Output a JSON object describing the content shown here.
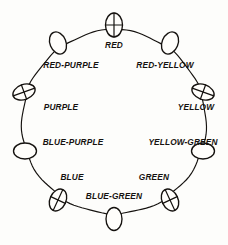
{
  "diagram": {
    "type": "color-wheel-diagram",
    "ink_color": "#15120f",
    "background_color": "#fdfdfb",
    "ring": {
      "center_x": 114,
      "center_y": 122,
      "radius": 92
    },
    "nodes": [
      {
        "id": "red",
        "label": "RED",
        "angle_deg": 90,
        "cx": 114,
        "cy": 25,
        "rx": 8.5,
        "ry": 12.0,
        "rotation_deg": 0,
        "mark": "cross",
        "label_x": 114,
        "label_y": 46,
        "label_anchor": "middle"
      },
      {
        "id": "red-yellow",
        "label": "RED-YELLOW",
        "angle_deg": 54,
        "cx": 170,
        "cy": 43,
        "rx": 8.0,
        "ry": 11.5,
        "rotation_deg": 22,
        "mark": "none",
        "label_x": 165,
        "label_y": 66,
        "label_anchor": "middle"
      },
      {
        "id": "yellow",
        "label": "YELLOW",
        "angle_deg": 18,
        "cx": 203,
        "cy": 92,
        "rx": 11.5,
        "ry": 7.5,
        "rotation_deg": 20,
        "mark": "cross",
        "label_x": 196,
        "label_y": 108,
        "label_anchor": "middle"
      },
      {
        "id": "yellow-green",
        "label": "YELLOW-GREEN",
        "angle_deg": -18,
        "cx": 203,
        "cy": 151,
        "rx": 11.5,
        "ry": 8.0,
        "rotation_deg": 0,
        "mark": "none",
        "label_x": 183,
        "label_y": 143,
        "label_anchor": "middle"
      },
      {
        "id": "green",
        "label": "GREEN",
        "angle_deg": -54,
        "cx": 170,
        "cy": 200,
        "rx": 8.0,
        "ry": 11.5,
        "rotation_deg": -25,
        "mark": "cross",
        "label_x": 154,
        "label_y": 178,
        "label_anchor": "middle"
      },
      {
        "id": "blue-green",
        "label": "BLUE-GREEN",
        "angle_deg": -90,
        "cx": 114,
        "cy": 219,
        "rx": 8.0,
        "ry": 11.5,
        "rotation_deg": 0,
        "mark": "none",
        "label_x": 114,
        "label_y": 197,
        "label_anchor": "middle"
      },
      {
        "id": "blue",
        "label": "BLUE",
        "angle_deg": -126,
        "cx": 58,
        "cy": 200,
        "rx": 8.0,
        "ry": 11.5,
        "rotation_deg": 25,
        "mark": "cross",
        "label_x": 72,
        "label_y": 178,
        "label_anchor": "middle"
      },
      {
        "id": "blue-purple",
        "label": "BLUE-PURPLE",
        "angle_deg": -162,
        "cx": 25,
        "cy": 151,
        "rx": 11.5,
        "ry": 8.0,
        "rotation_deg": 0,
        "mark": "none",
        "label_x": 73,
        "label_y": 143,
        "label_anchor": "middle"
      },
      {
        "id": "purple",
        "label": "PURPLE",
        "angle_deg": 162,
        "cx": 24,
        "cy": 92,
        "rx": 11.5,
        "ry": 7.5,
        "rotation_deg": -20,
        "mark": "cross",
        "label_x": 61,
        "label_y": 108,
        "label_anchor": "middle"
      },
      {
        "id": "red-purple",
        "label": "RED-PURPLE",
        "angle_deg": 126,
        "cx": 58,
        "cy": 43,
        "rx": 8.0,
        "ry": 11.5,
        "rotation_deg": -22,
        "mark": "none",
        "label_x": 71,
        "label_y": 66,
        "label_anchor": "middle"
      }
    ]
  }
}
